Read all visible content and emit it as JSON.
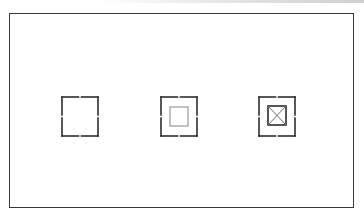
{
  "diagram": {
    "title": "",
    "frame": {
      "stroke": "#3a3a3a",
      "background": "#ffffff"
    },
    "elements": [
      {
        "id": "box-1",
        "label": "",
        "state": "empty",
        "icon": "segmented-square-icon",
        "outer_stroke": "#2e2e2e",
        "inner": null
      },
      {
        "id": "box-2",
        "label": "",
        "state": "inner-square",
        "icon": "segmented-square-with-inner-square-icon",
        "outer_stroke": "#2e2e2e",
        "inner": {
          "shape": "square",
          "stroke": "#9a9a9a"
        }
      },
      {
        "id": "box-3",
        "label": "",
        "state": "inner-square-crossed",
        "icon": "segmented-square-with-crossed-square-icon",
        "outer_stroke": "#2e2e2e",
        "inner": {
          "shape": "square-with-x",
          "stroke": "#2e2e2e",
          "cross_stroke": "#6a6a6a"
        }
      }
    ]
  }
}
